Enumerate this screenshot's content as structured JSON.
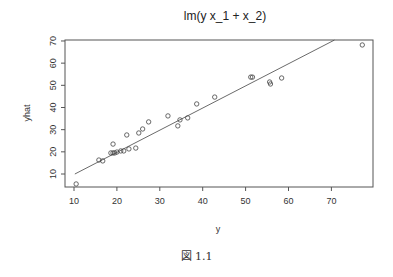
{
  "chart_data": {
    "type": "scatter",
    "title": "lm(y x_1 + x_2)",
    "xlabel": "y",
    "ylabel": "yhat",
    "xlim": [
      8.5,
      79.5
    ],
    "ylim": [
      2.5,
      70
    ],
    "x_ticks": [
      10,
      20,
      30,
      40,
      50,
      60,
      70
    ],
    "y_ticks": [
      10,
      20,
      30,
      40,
      50,
      60,
      70
    ],
    "grid": false,
    "legend": null,
    "points": [
      {
        "x": 10.5,
        "y": 5.5
      },
      {
        "x": 15.8,
        "y": 16.3
      },
      {
        "x": 16.7,
        "y": 15.9
      },
      {
        "x": 18.6,
        "y": 19.5
      },
      {
        "x": 19.1,
        "y": 19.5
      },
      {
        "x": 19.1,
        "y": 23.5
      },
      {
        "x": 19.5,
        "y": 19.5
      },
      {
        "x": 20.0,
        "y": 19.9
      },
      {
        "x": 20.9,
        "y": 20.4
      },
      {
        "x": 21.6,
        "y": 20.4
      },
      {
        "x": 22.3,
        "y": 27.6
      },
      {
        "x": 22.8,
        "y": 21.3
      },
      {
        "x": 24.4,
        "y": 21.7
      },
      {
        "x": 25.1,
        "y": 28.5
      },
      {
        "x": 26.0,
        "y": 30.3
      },
      {
        "x": 27.4,
        "y": 33.5
      },
      {
        "x": 31.9,
        "y": 36.2
      },
      {
        "x": 34.2,
        "y": 31.7
      },
      {
        "x": 34.7,
        "y": 34.4
      },
      {
        "x": 36.5,
        "y": 35.3
      },
      {
        "x": 38.6,
        "y": 41.6
      },
      {
        "x": 42.8,
        "y": 44.7
      },
      {
        "x": 51.2,
        "y": 53.7
      },
      {
        "x": 51.6,
        "y": 53.7
      },
      {
        "x": 55.6,
        "y": 51.5
      },
      {
        "x": 55.8,
        "y": 50.6
      },
      {
        "x": 58.4,
        "y": 53.3
      },
      {
        "x": 77.2,
        "y": 68.2
      }
    ],
    "reference_line": {
      "x1": 10.2,
      "y1": 10.0,
      "x2": 70.7,
      "y2": 70.4
    }
  },
  "caption": "図 1.1"
}
